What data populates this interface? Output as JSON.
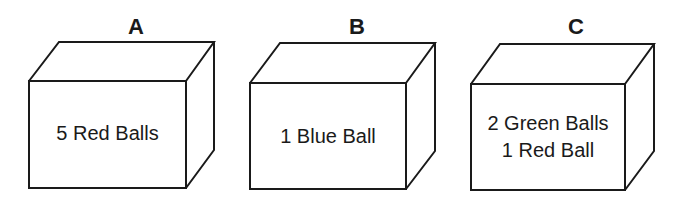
{
  "boxes": [
    {
      "label": "A",
      "lines": [
        "5 Red Balls",
        ""
      ]
    },
    {
      "label": "B",
      "lines": [
        "1 Blue Ball",
        ""
      ]
    },
    {
      "label": "C",
      "lines": [
        "2 Green Balls",
        "1 Red Ball"
      ]
    }
  ],
  "colors": {
    "stroke": "#1a1a1a",
    "background": "#ffffff"
  }
}
